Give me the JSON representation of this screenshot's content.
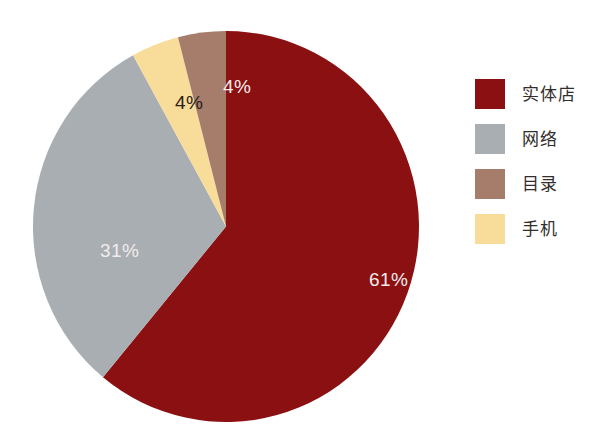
{
  "chart_data": {
    "type": "pie",
    "title": "",
    "subtitle": "",
    "xlabel": "",
    "ylabel": "",
    "grid": false,
    "legend_position": "right",
    "start_angle_deg": 0,
    "direction": "clockwise",
    "categories": [
      "实体店",
      "网络",
      "手机",
      "目录"
    ],
    "values": [
      61,
      31,
      4,
      4
    ],
    "unit": "%",
    "slices": [
      {
        "label": "实体店",
        "value": 61,
        "value_text": "61%",
        "color": "#8b1012",
        "label_color": "#f2ecec",
        "legend_order": 1
      },
      {
        "label": "网络",
        "value": 31,
        "value_text": "31%",
        "color": "#a8aeb2",
        "label_color": "#f2ecec",
        "legend_order": 2
      },
      {
        "label": "手机",
        "value": 4,
        "value_text": "4%",
        "color": "#f8dc9a",
        "label_color": "#2b2118",
        "legend_order": 4
      },
      {
        "label": "目录",
        "value": 4,
        "value_text": "4%",
        "color": "#a67c6a",
        "label_color": "#f2ecec",
        "legend_order": 3
      }
    ]
  },
  "legend": {
    "items": [
      {
        "label": "实体店",
        "color": "#8b1012"
      },
      {
        "label": "网络",
        "color": "#a8aeb2"
      },
      {
        "label": "目录",
        "color": "#a67c6a"
      },
      {
        "label": "手机",
        "color": "#f8dc9a"
      }
    ]
  },
  "colors": {
    "background": "#ffffff",
    "store_red": "#8b1012",
    "web_gray": "#a8aeb2",
    "catalog_brown": "#a67c6a",
    "mobile_yellow": "#f8dc9a",
    "label_light": "#f2ecec",
    "label_dark": "#2b2118",
    "legend_text": "#332e2c"
  }
}
